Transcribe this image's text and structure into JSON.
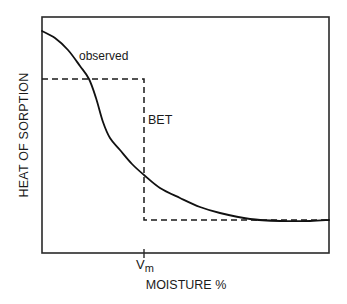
{
  "chart_data": {
    "type": "line",
    "title": "",
    "xlabel": "MOISTURE %",
    "ylabel": "HEAT OF SORPTION",
    "x_ticks": [
      {
        "label": "Vm",
        "position": "monolayer moisture"
      }
    ],
    "y_ticks": [],
    "grid": false,
    "legend": null,
    "series": [
      {
        "name": "observed",
        "style": "solid",
        "points_px": [
          [
            42,
            31
          ],
          [
            55,
            38
          ],
          [
            68,
            50
          ],
          [
            80,
            66
          ],
          [
            89,
            79
          ],
          [
            96,
            98
          ],
          [
            103,
            122
          ],
          [
            110,
            138
          ],
          [
            120,
            150
          ],
          [
            132,
            164
          ],
          [
            144,
            175
          ],
          [
            160,
            188
          ],
          [
            180,
            198
          ],
          [
            200,
            207
          ],
          [
            220,
            213
          ],
          [
            250,
            219
          ],
          [
            280,
            221
          ],
          [
            310,
            221
          ],
          [
            329,
            220
          ]
        ]
      },
      {
        "name": "BET",
        "style": "dashed",
        "description": "step function: high constant up to Vm, then low constant",
        "points_px": [
          [
            42,
            79
          ],
          [
            144,
            79
          ],
          [
            144,
            220
          ],
          [
            329,
            220
          ]
        ]
      }
    ],
    "annotations": [
      {
        "text": "observed",
        "x": 79,
        "y": 49
      },
      {
        "text": "BET",
        "x": 148,
        "y": 113
      }
    ],
    "plot_area_px": {
      "left": 42,
      "top": 17,
      "right": 329,
      "bottom": 253
    }
  },
  "labels": {
    "ylabel": "HEAT OF SORPTION",
    "xlabel": "MOISTURE %",
    "observed": "observed",
    "bet": "BET",
    "vm_main": "V",
    "vm_sub": "m"
  }
}
